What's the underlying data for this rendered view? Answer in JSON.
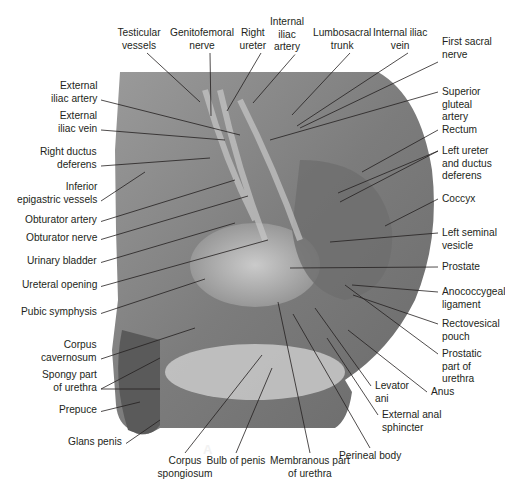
{
  "figure": {
    "panel_letter": "A",
    "colors": {
      "label_text": "#231f20",
      "leader_line": "#231f20",
      "background": "#ffffff"
    }
  },
  "labels": {
    "left": [
      {
        "id": "external-iliac-artery",
        "lines": [
          "External",
          "iliac artery"
        ],
        "x": 97,
        "y": 80,
        "anchor": "r",
        "tx": 240,
        "ty": 135
      },
      {
        "id": "external-iliac-vein",
        "lines": [
          "External",
          "iliac vein"
        ],
        "x": 97,
        "y": 110,
        "anchor": "r",
        "tx": 225,
        "ty": 140
      },
      {
        "id": "right-ductus-deferens",
        "lines": [
          "Right ductus",
          "deferens"
        ],
        "x": 97,
        "y": 146,
        "anchor": "r",
        "tx": 210,
        "ty": 158
      },
      {
        "id": "inferior-epigastric-vessels",
        "lines": [
          "Inferior",
          "epigastric vessels"
        ],
        "x": 97,
        "y": 181,
        "anchor": "r",
        "tx": 145,
        "ty": 172
      },
      {
        "id": "obturator-artery",
        "lines": [
          "Obturator artery"
        ],
        "x": 97,
        "y": 214,
        "anchor": "r",
        "tx": 235,
        "ty": 180
      },
      {
        "id": "obturator-nerve",
        "lines": [
          "Obturator nerve"
        ],
        "x": 97,
        "y": 232,
        "anchor": "r",
        "tx": 248,
        "ty": 196
      },
      {
        "id": "urinary-bladder",
        "lines": [
          "Urinary bladder"
        ],
        "x": 97,
        "y": 255,
        "anchor": "r",
        "tx": 235,
        "ty": 223
      },
      {
        "id": "ureteral-opening",
        "lines": [
          "Ureteral opening"
        ],
        "x": 97,
        "y": 279,
        "anchor": "r",
        "tx": 268,
        "ty": 240
      },
      {
        "id": "pubic-symphysis",
        "lines": [
          "Pubic symphysis"
        ],
        "x": 97,
        "y": 306,
        "anchor": "r",
        "tx": 205,
        "ty": 279
      },
      {
        "id": "corpus-cavernosum",
        "lines": [
          "Corpus",
          "cavernosum"
        ],
        "x": 97,
        "y": 339,
        "anchor": "r",
        "tx": 195,
        "ty": 328
      },
      {
        "id": "spongy-part-of-urethra",
        "lines": [
          "Spongy part",
          "of urethra"
        ],
        "x": 97,
        "y": 369,
        "anchor": "r",
        "tx": 160,
        "ty": 358,
        "tx2": 160,
        "ty2": 389
      },
      {
        "id": "prepuce",
        "lines": [
          "Prepuce"
        ],
        "x": 97,
        "y": 404,
        "anchor": "r",
        "tx": 140,
        "ty": 402
      },
      {
        "id": "glans-penis",
        "lines": [
          "Glans penis"
        ],
        "x": 122,
        "y": 436,
        "anchor": "r",
        "tx": 160,
        "ty": 420
      }
    ],
    "top": [
      {
        "id": "testicular-vessels",
        "lines": [
          "Testicular",
          "vessels"
        ],
        "x": 139,
        "y": 27,
        "anchor": "c",
        "tx": 200,
        "ty": 102
      },
      {
        "id": "genitofemoral-nerve",
        "lines": [
          "Genitofemoral",
          "nerve"
        ],
        "x": 202,
        "y": 27,
        "anchor": "c",
        "tx": 211,
        "ty": 116
      },
      {
        "id": "right-ureter",
        "lines": [
          "Right",
          "ureter"
        ],
        "x": 253,
        "y": 27,
        "anchor": "c",
        "tx": 227,
        "ty": 111
      },
      {
        "id": "internal-iliac-artery",
        "lines": [
          "Internal",
          "iliac",
          "artery"
        ],
        "x": 287,
        "y": 16,
        "anchor": "c",
        "tx": 253,
        "ty": 103
      },
      {
        "id": "lumbosacral-trunk",
        "lines": [
          "Lumbosacral",
          "trunk"
        ],
        "x": 342,
        "y": 27,
        "anchor": "c",
        "tx": 292,
        "ty": 115
      },
      {
        "id": "internal-iliac-vein",
        "lines": [
          "Internal iliac",
          "vein"
        ],
        "x": 400,
        "y": 27,
        "anchor": "c",
        "tx": 297,
        "ty": 126
      },
      {
        "id": "first-sacral-nerve",
        "lines": [
          "First sacral",
          "nerve"
        ],
        "x": 442,
        "y": 36,
        "anchor": "l",
        "tx": 300,
        "ty": 128
      }
    ],
    "right": [
      {
        "id": "superior-gluteal-artery",
        "lines": [
          "Superior",
          "gluteal",
          "artery"
        ],
        "x": 442,
        "y": 86,
        "anchor": "l",
        "tx": 270,
        "ty": 140
      },
      {
        "id": "rectum",
        "lines": [
          "Rectum"
        ],
        "x": 442,
        "y": 124,
        "anchor": "l",
        "tx": 362,
        "ty": 172
      },
      {
        "id": "left-ureter-and-ductus-deferens",
        "lines": [
          "Left ureter",
          "and ductus",
          "deferens"
        ],
        "x": 442,
        "y": 145,
        "anchor": "l",
        "tx": 338,
        "ty": 193,
        "tx2": 340,
        "ty2": 202
      },
      {
        "id": "coccyx",
        "lines": [
          "Coccyx"
        ],
        "x": 442,
        "y": 193,
        "anchor": "l",
        "tx": 385,
        "ty": 226
      },
      {
        "id": "left-seminal-vesicle",
        "lines": [
          "Left seminal",
          "vesicle"
        ],
        "x": 442,
        "y": 227,
        "anchor": "l",
        "tx": 330,
        "ty": 242
      },
      {
        "id": "prostate",
        "lines": [
          "Prostate"
        ],
        "x": 442,
        "y": 261,
        "anchor": "l",
        "tx": 290,
        "ty": 268
      },
      {
        "id": "anococcygeal-ligament",
        "lines": [
          "Anococcygeal",
          "ligament"
        ],
        "x": 442,
        "y": 286,
        "anchor": "l",
        "tx": 352,
        "ty": 285
      },
      {
        "id": "rectovesical-pouch",
        "lines": [
          "Rectovesical",
          "pouch"
        ],
        "x": 442,
        "y": 318,
        "anchor": "l",
        "tx": 353,
        "ty": 295
      },
      {
        "id": "prostatic-part-of-urethra",
        "lines": [
          "Prostatic",
          "part of",
          "urethra"
        ],
        "x": 442,
        "y": 348,
        "anchor": "l",
        "tx": 345,
        "ty": 285
      },
      {
        "id": "anus",
        "lines": [
          "Anus"
        ],
        "x": 431,
        "y": 386,
        "anchor": "l",
        "tx": 348,
        "ty": 330
      },
      {
        "id": "levator-ani",
        "lines": [
          "Levator",
          "ani"
        ],
        "x": 375,
        "y": 380,
        "anchor": "l",
        "tx": 315,
        "ty": 308
      },
      {
        "id": "external-anal-sphincter",
        "lines": [
          "External anal",
          "sphincter"
        ],
        "x": 382,
        "y": 409,
        "anchor": "l",
        "tx": 327,
        "ty": 338
      }
    ],
    "bottom": [
      {
        "id": "corpus-spongiosum",
        "lines": [
          "Corpus",
          "spongiosum"
        ],
        "x": 185,
        "y": 455,
        "anchor": "c",
        "tx": 262,
        "ty": 355
      },
      {
        "id": "bulb-of-penis",
        "lines": [
          "Bulb of penis"
        ],
        "x": 236,
        "y": 455,
        "anchor": "c",
        "tx": 272,
        "ty": 368
      },
      {
        "id": "membranous-part-of-urethra",
        "lines": [
          "Membranous part",
          "of urethra"
        ],
        "x": 310,
        "y": 455,
        "anchor": "c",
        "tx": 278,
        "ty": 302
      },
      {
        "id": "perineal-body",
        "lines": [
          "Perineal body"
        ],
        "x": 370,
        "y": 450,
        "anchor": "c",
        "tx": 293,
        "ty": 314
      }
    ]
  }
}
